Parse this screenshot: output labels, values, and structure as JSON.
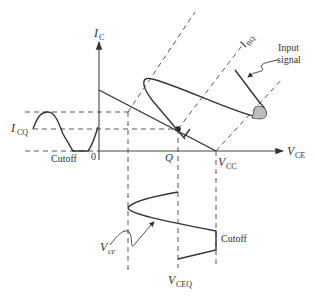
{
  "diagram": {
    "axes": {
      "y_label_main": "I",
      "y_label_sub": "C",
      "x_label_main": "V",
      "x_label_sub": "CE",
      "origin_label": "0"
    },
    "labels": {
      "icq_main": "I",
      "icq_sub": "CQ",
      "cutoff_left": "Cutoff",
      "cutoff_bottom": "Cutoff",
      "q_point": "Q",
      "vcc_main": "V",
      "vcc_sub": "CC",
      "vceq_main": "V",
      "vceq_sub": "CEQ",
      "vce_main": "V",
      "vce_sub": "ce",
      "ibq_main": "I",
      "ibq_sub": "BQ",
      "input_signal_line1": "Input",
      "input_signal_line2": "signal"
    },
    "colors": {
      "line": "#333333",
      "shaded_clip": "#bdbdbd",
      "background": "#ffffff"
    }
  }
}
